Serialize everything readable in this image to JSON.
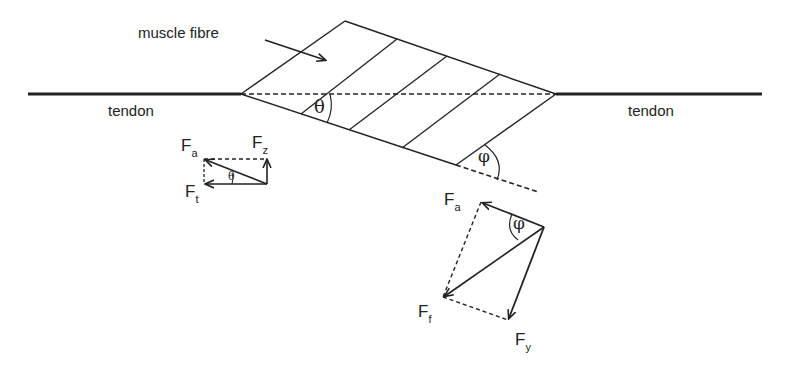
{
  "labels": {
    "muscle_fibre": "muscle fibre",
    "tendon_left": "tendon",
    "tendon_right": "tendon",
    "theta_main": "θ",
    "phi_main": "φ",
    "small_diagram": {
      "fa": "F",
      "fa_sub": "a",
      "fz": "F",
      "fz_sub": "z",
      "ft": "F",
      "ft_sub": "t",
      "theta": "θ"
    },
    "large_diagram": {
      "fa": "F",
      "fa_sub": "a",
      "ff": "F",
      "ff_sub": "f",
      "fy": "F",
      "fy_sub": "y",
      "phi": "φ"
    }
  },
  "colors": {
    "line": "#222222",
    "background": "#ffffff"
  }
}
